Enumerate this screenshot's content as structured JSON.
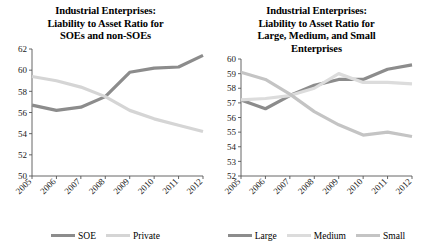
{
  "figure": {
    "background": "#ffffff",
    "panels": 2
  },
  "chart_data": [
    {
      "type": "line",
      "panel_id": "soe-vs-private",
      "title": "Industrial Enterprises: Liability to Asset Ratio for SOEs and non-SOEs",
      "title_lines": [
        "Industrial Enterprises:",
        "Liability to Asset Ratio for",
        "SOEs and non-SOEs"
      ],
      "xlabel": "",
      "ylabel": "",
      "x": [
        "2005",
        "2006",
        "2007",
        "2008",
        "2009",
        "2010",
        "2011",
        "2012"
      ],
      "categories": [
        "2005",
        "2006",
        "2007",
        "2008",
        "2009",
        "2010",
        "2011",
        "2012"
      ],
      "ylim": [
        50,
        62
      ],
      "yticks": [
        50,
        52,
        54,
        56,
        58,
        60,
        62
      ],
      "ytick_labels": [
        "50",
        "52",
        "54",
        "56",
        "58",
        "60",
        "62"
      ],
      "grid": false,
      "legend_position": "bottom",
      "series": [
        {
          "name": "SOE",
          "color": "#8c8c8c",
          "values": [
            56.7,
            56.2,
            56.5,
            57.5,
            59.8,
            60.2,
            60.3,
            61.4
          ]
        },
        {
          "name": "Private",
          "color": "#d5d5d5",
          "values": [
            59.4,
            59.0,
            58.4,
            57.5,
            56.2,
            55.4,
            54.8,
            54.2
          ]
        }
      ]
    },
    {
      "type": "line",
      "panel_id": "large-medium-small",
      "title": "Industrial Enterprises: Liability to Asset Ratio for Large, Medium, and Small Enterprises",
      "title_lines": [
        "Industrial Enterprises:",
        "Liability to Asset Ratio for",
        "Large, Medium, and Small",
        "Enterprises"
      ],
      "xlabel": "",
      "ylabel": "",
      "x": [
        "2005",
        "2006",
        "2007",
        "2008",
        "2009",
        "2010",
        "2011",
        "2012"
      ],
      "categories": [
        "2005",
        "2006",
        "2007",
        "2008",
        "2009",
        "2010",
        "2011",
        "2012"
      ],
      "ylim": [
        52,
        60
      ],
      "yticks": [
        52,
        53,
        54,
        55,
        56,
        57,
        58,
        59,
        60
      ],
      "ytick_labels": [
        "52",
        "53",
        "54",
        "55",
        "56",
        "57",
        "58",
        "59",
        "60"
      ],
      "grid": false,
      "legend_position": "bottom",
      "series": [
        {
          "name": "Large",
          "color": "#8c8c8c",
          "values": [
            57.2,
            56.6,
            57.5,
            58.2,
            58.6,
            58.6,
            59.3,
            59.6
          ]
        },
        {
          "name": "Medium",
          "color": "#dcdcdc",
          "values": [
            57.2,
            57.3,
            57.5,
            58.0,
            59.0,
            58.4,
            58.4,
            58.3
          ]
        },
        {
          "name": "Small",
          "color": "#c4c4c4",
          "values": [
            59.1,
            58.6,
            57.6,
            56.4,
            55.5,
            54.8,
            55.0,
            54.7
          ]
        }
      ]
    }
  ],
  "left_panel": {
    "title_line_1": "Industrial Enterprises:",
    "title_line_2": "Liability to Asset Ratio for",
    "title_line_3": "SOEs and non-SOEs",
    "legend": [
      {
        "label": "SOE",
        "color": "#8c8c8c"
      },
      {
        "label": "Private",
        "color": "#d5d5d5"
      }
    ]
  },
  "right_panel": {
    "title_line_1": "Industrial Enterprises:",
    "title_line_2": "Liability to Asset Ratio for",
    "title_line_3": "Large, Medium, and Small",
    "title_line_4": "Enterprises",
    "legend": [
      {
        "label": "Large",
        "color": "#8c8c8c"
      },
      {
        "label": "Medium",
        "color": "#dcdcdc"
      },
      {
        "label": "Small",
        "color": "#c4c4c4"
      }
    ]
  }
}
